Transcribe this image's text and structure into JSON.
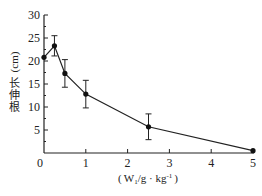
{
  "chart_data": {
    "type": "line",
    "title": "",
    "xlabel": "(W1/g · kg-1)",
    "xlabel_parts": {
      "open": "(",
      "w": "W",
      "sub": "1",
      "unit": "/g · kg",
      "sup": "-1",
      "close": ")"
    },
    "ylabel": "根伸长 (cm)",
    "ylabel_chars": [
      "根",
      "伸",
      "长"
    ],
    "ylabel_unit": "(cm)",
    "xlim": [
      0,
      5
    ],
    "ylim": [
      0,
      30
    ],
    "x_ticks": [
      0,
      1,
      2,
      3,
      4,
      5
    ],
    "x_tick_labels": [
      "0",
      "1",
      "2",
      "3",
      "4",
      "5"
    ],
    "y_ticks": [
      5,
      10,
      15,
      20,
      25,
      30
    ],
    "y_tick_labels": [
      "5",
      "10",
      "15",
      "20",
      "25",
      "30"
    ],
    "grid": false,
    "legend": null,
    "series": [
      {
        "name": "root elongation",
        "x": [
          0,
          0.25,
          0.5,
          1,
          2.5,
          5
        ],
        "y": [
          20.8,
          23.3,
          17.3,
          12.8,
          5.7,
          0.5
        ],
        "error": [
          0,
          2.2,
          3.0,
          3.0,
          2.8,
          0
        ]
      }
    ]
  }
}
